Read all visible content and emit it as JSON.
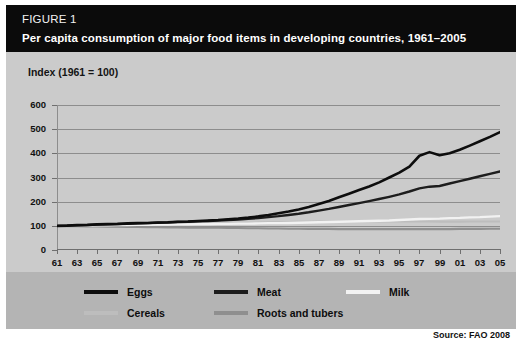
{
  "figure": {
    "label": "FIGURE 1",
    "title": "Per capita consumption of major food items in developing countries, 1961–2005"
  },
  "source": {
    "text": "Source: FAO 2008"
  },
  "colors": {
    "header_bg": "#0b0b0b",
    "panel_bg": "#cbcbcb",
    "legend_bg": "#b4b4b4",
    "grid": "#8d8d8d",
    "eggs": "#0d0d0d",
    "meat": "#1d1d1d",
    "milk": "#f2f2f2",
    "cereals": "#bdbdbd",
    "roots": "#8f8f8f"
  },
  "legend": {
    "items": [
      {
        "label": "Eggs",
        "color": "#0d0d0d"
      },
      {
        "label": "Meat",
        "color": "#1d1d1d"
      },
      {
        "label": "Milk",
        "color": "#f2f2f2"
      },
      {
        "label": "Cereals",
        "color": "#bdbdbd"
      },
      {
        "label": "Roots and tubers",
        "color": "#8f8f8f"
      }
    ]
  },
  "chart_data": {
    "type": "line",
    "title": "Per capita consumption of major food items in developing countries, 1961–2005",
    "ylabel": "Index (1961 = 100)",
    "xlabel": "",
    "ylim": [
      0,
      600
    ],
    "yticks": [
      0,
      100,
      200,
      300,
      400,
      500,
      600
    ],
    "ytick_labels": [
      "0",
      "100",
      "200",
      "300",
      "400",
      "500",
      "600"
    ],
    "xlim": [
      1961,
      2005
    ],
    "xticks": [
      1961,
      1963,
      1965,
      1967,
      1969,
      1971,
      1973,
      1975,
      1977,
      1979,
      1981,
      1983,
      1985,
      1987,
      1989,
      1991,
      1993,
      1995,
      1997,
      1999,
      2001,
      2003,
      2005
    ],
    "xtick_labels": [
      "61",
      "63",
      "65",
      "67",
      "69",
      "71",
      "73",
      "75",
      "77",
      "79",
      "81",
      "83",
      "85",
      "87",
      "89",
      "91",
      "93",
      "95",
      "97",
      "99",
      "01",
      "03",
      "05"
    ],
    "grid": "horizontal",
    "legend_position": "bottom",
    "x": [
      1961,
      1962,
      1963,
      1964,
      1965,
      1966,
      1967,
      1968,
      1969,
      1970,
      1971,
      1972,
      1973,
      1974,
      1975,
      1976,
      1977,
      1978,
      1979,
      1980,
      1981,
      1982,
      1983,
      1984,
      1985,
      1986,
      1987,
      1988,
      1989,
      1990,
      1991,
      1992,
      1993,
      1994,
      1995,
      1996,
      1997,
      1998,
      1999,
      2000,
      2001,
      2002,
      2003,
      2004,
      2005
    ],
    "series": [
      {
        "name": "Eggs",
        "color": "#0d0d0d",
        "values": [
          100,
          101,
          103,
          104,
          106,
          107,
          108,
          110,
          111,
          112,
          114,
          115,
          117,
          118,
          120,
          122,
          124,
          127,
          130,
          134,
          139,
          145,
          152,
          159,
          168,
          178,
          190,
          203,
          218,
          233,
          248,
          263,
          280,
          300,
          320,
          345,
          390,
          405,
          392,
          400,
          415,
          432,
          450,
          468,
          488
        ]
      },
      {
        "name": "Meat",
        "color": "#1d1d1d",
        "values": [
          100,
          101,
          102,
          103,
          105,
          106,
          107,
          108,
          110,
          111,
          113,
          114,
          116,
          117,
          119,
          120,
          122,
          124,
          126,
          129,
          132,
          136,
          140,
          145,
          150,
          156,
          163,
          170,
          178,
          186,
          194,
          202,
          211,
          220,
          230,
          242,
          255,
          262,
          265,
          275,
          285,
          295,
          305,
          315,
          325
        ]
      },
      {
        "name": "Milk",
        "color": "#f2f2f2",
        "values": [
          100,
          100,
          101,
          101,
          102,
          102,
          103,
          103,
          104,
          104,
          105,
          105,
          106,
          106,
          107,
          107,
          108,
          108,
          109,
          109,
          110,
          111,
          111,
          112,
          113,
          114,
          115,
          116,
          117,
          118,
          119,
          120,
          121,
          122,
          124,
          126,
          128,
          129,
          130,
          132,
          133,
          135,
          136,
          138,
          140
        ]
      },
      {
        "name": "Cereals",
        "color": "#bdbdbd",
        "values": [
          100,
          100,
          101,
          101,
          102,
          102,
          103,
          103,
          104,
          105,
          105,
          106,
          106,
          107,
          108,
          109,
          110,
          111,
          112,
          112,
          113,
          114,
          114,
          115,
          116,
          116,
          117,
          117,
          118,
          118,
          118,
          118,
          118,
          118,
          118,
          118,
          118,
          118,
          117,
          117,
          117,
          118,
          118,
          118,
          118
        ]
      },
      {
        "name": "Roots and tubers",
        "color": "#8f8f8f",
        "values": [
          100,
          99,
          99,
          98,
          98,
          97,
          97,
          96,
          96,
          95,
          95,
          94,
          94,
          93,
          93,
          92,
          92,
          91,
          91,
          90,
          90,
          89,
          89,
          88,
          88,
          87,
          87,
          87,
          86,
          86,
          86,
          86,
          86,
          86,
          86,
          86,
          86,
          86,
          86,
          86,
          87,
          87,
          87,
          88,
          88
        ]
      }
    ]
  }
}
